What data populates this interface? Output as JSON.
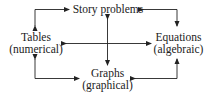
{
  "nodes": {
    "top": {
      "title": "Story problems"
    },
    "left": {
      "title": "Tables",
      "subtitle": "(numerical)"
    },
    "right": {
      "title": "Equations",
      "subtitle": "(algebraic)"
    },
    "bottom": {
      "title": "Graphs",
      "subtitle": "(graphical)"
    }
  },
  "colors": {
    "ink": "#222222",
    "background": "#ffffff"
  }
}
